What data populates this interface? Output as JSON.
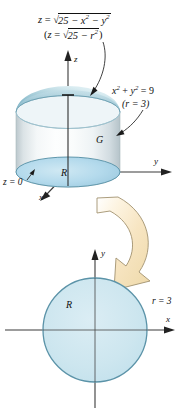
{
  "figure": {
    "labels": {
      "sphere_equation_cartesian": "z = √(25 − x² − y²)",
      "sphere_equation_polar": "(z = √(25 − r²))",
      "cylinder_equation_cartesian": "x² + y² = 9",
      "cylinder_equation_polar": "(r = 3)",
      "solid_label": "G",
      "base_region_label": "R",
      "plane_label": "z = 0",
      "radius_label": "r = 3",
      "axis_z": "z",
      "axis_y": "y",
      "axis_x": "x",
      "axis_y_lower": "y",
      "axis_x_lower": "x",
      "region_label_lower": "R"
    },
    "parts": {
      "eq1_pre": "z",
      "eq1_eq": " = ",
      "eq1_radicand": "25 − x",
      "eq1_sup1": "2",
      "eq1_mid": " − y",
      "eq1_sup2": "2",
      "eq2_open": "(",
      "eq2_pre": "z",
      "eq2_eq": " = ",
      "eq2_radicand": "25 − r",
      "eq2_sup": "2",
      "eq2_close": ")",
      "cyl1_x": "x",
      "cyl1_sup1": "2",
      "cyl1_plus": " + ",
      "cyl1_y": "y",
      "cyl1_sup2": "2",
      "cyl1_eq": " = 9",
      "cyl2": "(r = 3)",
      "z0": "z = 0",
      "r3": "r = 3",
      "radical": "√"
    },
    "colors": {
      "dome_light": "#d8ecf2",
      "dome_mid": "#9fc8d6",
      "dome_dark": "#7fb3c4",
      "cylinder_body_light": "#fdfefe",
      "cylinder_body_shade": "#c9d3d8",
      "base_disk_fill": "#b9dced",
      "base_disk_stroke": "#5f97ac",
      "circle_fill": "#cfe7ef",
      "circle_stroke": "#5b93a8",
      "arrow_fill": "#f6e3bd",
      "arrow_stroke": "#9c8f6e",
      "axis": "#3a3a3a",
      "text": "#111111",
      "background": "#ffffff"
    },
    "geometry": {
      "cylinder_center_x": 68,
      "cylinder_top_y": 95,
      "cylinder_bottom_y": 172,
      "cylinder_rx": 52,
      "cylinder_ry": 15,
      "disk_center": [
        95,
        330
      ],
      "disk_radius": 52
    }
  }
}
